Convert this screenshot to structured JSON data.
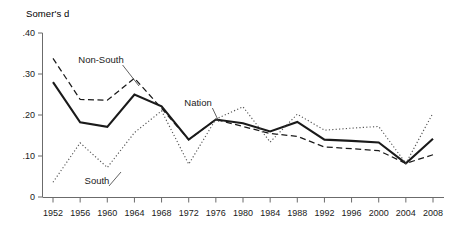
{
  "chart_data": {
    "type": "line",
    "title": "",
    "ylabel": "Somer's d",
    "xlabel": "",
    "x": [
      1952,
      1956,
      1960,
      1964,
      1968,
      1972,
      1976,
      1980,
      1984,
      1988,
      1992,
      1996,
      2000,
      2004,
      2008
    ],
    "xtick_labels": [
      "1952",
      "1956",
      "1960",
      "1964",
      "1968",
      "1972",
      "1976",
      "1980",
      "1984",
      "1988",
      "1992",
      "1996",
      "2000",
      "2004",
      "2008"
    ],
    "ytick_labels": [
      "0",
      ".10",
      ".20",
      ".30",
      ".40"
    ],
    "ytick_values": [
      0,
      0.1,
      0.2,
      0.3,
      0.4
    ],
    "ylim": [
      0,
      0.4
    ],
    "grid": false,
    "legend_position": "inline-annotations",
    "series": [
      {
        "name": "Nation",
        "style": "solid",
        "color": "#1a1a1a",
        "values": [
          0.28,
          0.182,
          0.171,
          0.25,
          0.221,
          0.14,
          0.189,
          0.18,
          0.16,
          0.183,
          0.14,
          0.137,
          0.133,
          0.082,
          0.142
        ]
      },
      {
        "name": "Non-South",
        "style": "dashed",
        "color": "#1a1a1a",
        "values": [
          0.338,
          0.238,
          0.236,
          0.29,
          0.216,
          0.14,
          0.189,
          0.172,
          0.155,
          0.148,
          0.122,
          0.118,
          0.113,
          0.082,
          0.103
        ]
      },
      {
        "name": "South",
        "style": "dotted",
        "color": "#555555",
        "values": [
          0.036,
          0.132,
          0.072,
          0.157,
          0.21,
          0.08,
          0.19,
          0.22,
          0.134,
          0.202,
          0.163,
          0.168,
          0.172,
          0.082,
          0.205
        ]
      }
    ],
    "annotations": [
      {
        "text": "Non-South",
        "x_px": 101,
        "y_px": 63,
        "leader_to_x": 139,
        "leader_to_y": 86
      },
      {
        "text": "South",
        "x_px": 97,
        "y_px": 184,
        "leader_to_x": 121,
        "leader_to_y": 172
      },
      {
        "text": "Nation",
        "x_px": 198,
        "y_px": 106,
        "leader_to_x": 219,
        "leader_to_y": 122
      }
    ]
  }
}
